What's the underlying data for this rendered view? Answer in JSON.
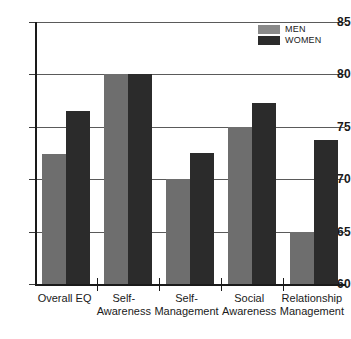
{
  "chart_data": {
    "type": "bar",
    "title": "",
    "subtitle": "",
    "xlabel": "",
    "ylabel": "",
    "ylim": [
      60,
      85
    ],
    "yticks": [
      60,
      65,
      70,
      75,
      80,
      85
    ],
    "grid": true,
    "legend_position": "top-right",
    "categories": [
      "Overall EQ",
      "Self-\nAwareness",
      "Self-\nManagement",
      "Social\nAwareness",
      "Relationship\nManagement"
    ],
    "series": [
      {
        "name": "MEN",
        "color": "#6e6e6e",
        "values": [
          72.4,
          80.0,
          70.0,
          75.0,
          65.0
        ]
      },
      {
        "name": "WOMEN",
        "color": "#2b2b2b",
        "values": [
          76.5,
          80.0,
          72.5,
          77.3,
          73.7
        ]
      }
    ]
  },
  "axis": {
    "y_tick_labels": [
      "85",
      "80",
      "75",
      "70",
      "65",
      "60"
    ]
  },
  "legend": {
    "items": [
      {
        "label": "MEN",
        "swatch": "legend-swatch-men"
      },
      {
        "label": "WOMEN",
        "swatch": "legend-swatch-women"
      }
    ]
  }
}
